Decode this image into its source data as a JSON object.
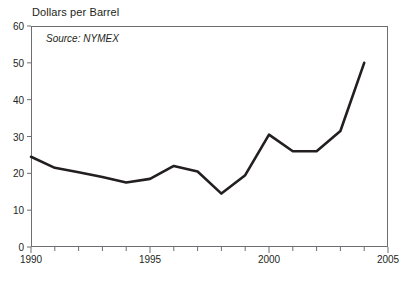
{
  "chart_data": {
    "type": "line",
    "title": "Dollars per Barrel",
    "annotation": "Source: NYMEX",
    "xlabel": "",
    "ylabel": "",
    "xlim": [
      1990,
      2005
    ],
    "ylim": [
      0,
      60
    ],
    "grid": false,
    "legend": "none",
    "line_color": "#231f20",
    "axis_color": "#6d6e71",
    "y_ticks": [
      0,
      10,
      20,
      30,
      40,
      50,
      60
    ],
    "x_ticks": [
      1990,
      1991,
      1992,
      1993,
      1994,
      1995,
      1996,
      1997,
      1998,
      1999,
      2000,
      2001,
      2002,
      2003,
      2004,
      2005
    ],
    "x_tick_labels": [
      1990,
      1995,
      2000,
      2005
    ],
    "x": [
      1990,
      1991,
      1992,
      1993,
      1994,
      1995,
      1996,
      1997,
      1998,
      1999,
      2000,
      2001,
      2002,
      2003,
      2004
    ],
    "values": [
      24.5,
      21.5,
      20.3,
      19.0,
      17.5,
      18.5,
      22.0,
      20.5,
      14.5,
      19.5,
      30.5,
      26.0,
      26.0,
      31.5,
      50.0
    ],
    "series_name": "Crude Oil Price"
  }
}
